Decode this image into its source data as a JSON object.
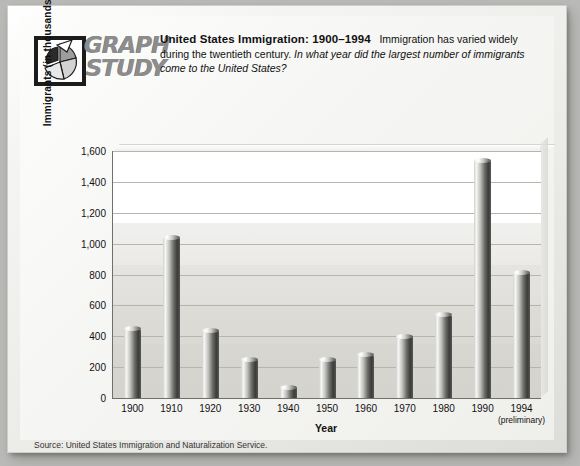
{
  "logo": {
    "line1": "GRAPH",
    "line2": "STUDY",
    "mark_name": "pie-chart-logo"
  },
  "header": {
    "title": "United States Immigration: 1900–1994",
    "body": "Immigration has varied widely during the twentieth century.",
    "question": "In what year did the largest number of immigrants come to the United States?"
  },
  "source": "Source: United States Immigration and Naturalization Service.",
  "chart_data": {
    "type": "bar",
    "title": "United States Immigration: 1900–1994",
    "xlabel": "Year",
    "ylabel": "Immigrants (in thousands)",
    "categories": [
      "1900",
      "1910",
      "1920",
      "1930",
      "1940",
      "1950",
      "1960",
      "1970",
      "1980",
      "1990",
      "1994"
    ],
    "category_sublabels": [
      "",
      "",
      "",
      "",
      "",
      "",
      "",
      "",
      "",
      "",
      "(preliminary)"
    ],
    "values": [
      450,
      1040,
      440,
      250,
      70,
      250,
      280,
      400,
      540,
      1540,
      815
    ],
    "ylim": [
      0,
      1600
    ],
    "yticks": [
      0,
      200,
      400,
      600,
      800,
      1000,
      1200,
      1400,
      1600
    ],
    "ytick_labels": [
      "0",
      "200",
      "400",
      "600",
      "800",
      "1,000",
      "1,200",
      "1,400",
      "1,600"
    ],
    "grid": true,
    "legend": "none",
    "bar_color": "#3b3b39",
    "plot_background": "#eceae7"
  }
}
